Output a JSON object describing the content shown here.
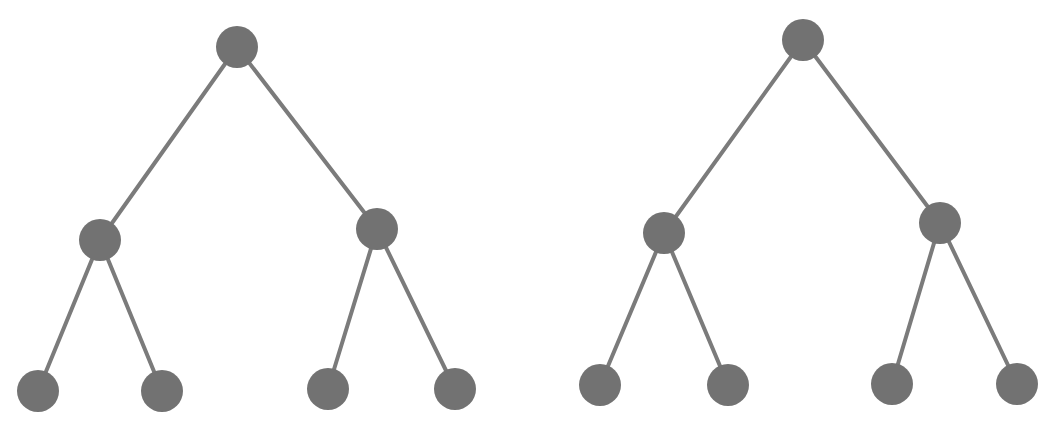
{
  "diagram": {
    "type": "binary-trees",
    "colors": {
      "node": "#727272",
      "edge": "#7b7b7b",
      "background": "#ffffff"
    },
    "node_radius": 21,
    "edge_width": 4,
    "trees": [
      {
        "name": "left-tree",
        "nodes": [
          {
            "id": "root",
            "x": 237,
            "y": 47
          },
          {
            "id": "l",
            "x": 100,
            "y": 240
          },
          {
            "id": "r",
            "x": 377,
            "y": 229
          },
          {
            "id": "ll",
            "x": 38,
            "y": 391
          },
          {
            "id": "lr",
            "x": 162,
            "y": 391
          },
          {
            "id": "rl",
            "x": 328,
            "y": 389
          },
          {
            "id": "rr",
            "x": 455,
            "y": 389
          }
        ],
        "edges": [
          [
            "root",
            "l"
          ],
          [
            "root",
            "r"
          ],
          [
            "l",
            "ll"
          ],
          [
            "l",
            "lr"
          ],
          [
            "r",
            "rl"
          ],
          [
            "r",
            "rr"
          ]
        ]
      },
      {
        "name": "right-tree",
        "nodes": [
          {
            "id": "root",
            "x": 803,
            "y": 40
          },
          {
            "id": "l",
            "x": 664,
            "y": 233
          },
          {
            "id": "r",
            "x": 940,
            "y": 223
          },
          {
            "id": "ll",
            "x": 600,
            "y": 385
          },
          {
            "id": "lr",
            "x": 728,
            "y": 385
          },
          {
            "id": "rl",
            "x": 892,
            "y": 384
          },
          {
            "id": "rr",
            "x": 1017,
            "y": 384
          }
        ],
        "edges": [
          [
            "root",
            "l"
          ],
          [
            "root",
            "r"
          ],
          [
            "l",
            "ll"
          ],
          [
            "l",
            "lr"
          ],
          [
            "r",
            "rl"
          ],
          [
            "r",
            "rr"
          ]
        ]
      }
    ]
  }
}
